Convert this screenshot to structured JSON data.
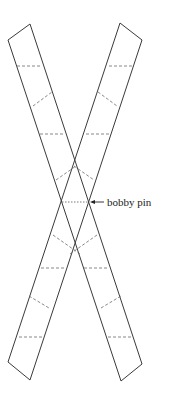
{
  "figure": {
    "annotation": {
      "label": "bobby pin"
    },
    "colors": {
      "stroke": "#3a3a3a",
      "fold_line": "#6a6a6a",
      "background": "#ffffff"
    },
    "strips": [
      {
        "name": "strip-top-left-to-bottom-right",
        "outline": [
          [
            8,
            40
          ],
          [
            30,
            24
          ],
          [
            142,
            364
          ],
          [
            121,
            381
          ]
        ]
      },
      {
        "name": "strip-top-right-to-bottom-left",
        "outline": [
          [
            120,
            23
          ],
          [
            142,
            40
          ],
          [
            30,
            380
          ],
          [
            8,
            362
          ]
        ]
      }
    ]
  }
}
